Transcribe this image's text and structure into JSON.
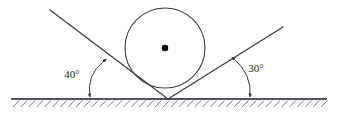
{
  "figure": {
    "type": "geometry-diagram",
    "background_color": "#ffffff",
    "stroke_color": "#3d3d46",
    "label_color": "#1c1c22",
    "canvas": {
      "width": 337,
      "height": 116
    }
  },
  "ground": {
    "name": "ground-line",
    "x_start": 11,
    "x_end": 327,
    "y": 99,
    "hatching": {
      "count": 40,
      "length": 9,
      "angle_deg": 45,
      "side": "below",
      "direction": "up-right"
    }
  },
  "vertex": {
    "label": "wedge-vertex",
    "x": 168,
    "y": 99
  },
  "circle": {
    "name": "inscribed-circle",
    "center_x": 165,
    "center_y": 48,
    "radius": 40,
    "center_dot_radius": 3.2,
    "center_dot_color": "#000000"
  },
  "rays": [
    {
      "name": "left-ray",
      "from_x": 168,
      "from_y": 99,
      "to_x": 50,
      "to_y": 10,
      "angle_with_ground_deg": 40
    },
    {
      "name": "right-ray",
      "from_x": 168,
      "from_y": 99,
      "to_x": 283,
      "to_y": 27,
      "angle_with_ground_deg": 30
    }
  ],
  "angles": [
    {
      "id": "left-angle",
      "label": "40°",
      "value": 40,
      "unit": "degrees",
      "label_x": 72,
      "label_y": 78,
      "arc_start_x": 104,
      "arc_start_y": 61,
      "arc_end_x": 90,
      "arc_end_y": 97,
      "arc_ctrl_x": 86,
      "arc_ctrl_y": 75
    },
    {
      "id": "right-angle",
      "label": "30°",
      "value": 30,
      "unit": "degrees",
      "label_x": 256,
      "label_y": 72,
      "arc_start_x": 234,
      "arc_start_y": 59,
      "arc_end_x": 250,
      "arc_end_y": 97,
      "arc_ctrl_x": 252,
      "arc_ctrl_y": 74
    }
  ]
}
